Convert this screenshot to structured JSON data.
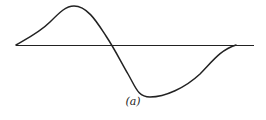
{
  "figure": {
    "label": "(a)",
    "colors": {
      "stroke": "#222222",
      "background": "#ffffff"
    }
  }
}
